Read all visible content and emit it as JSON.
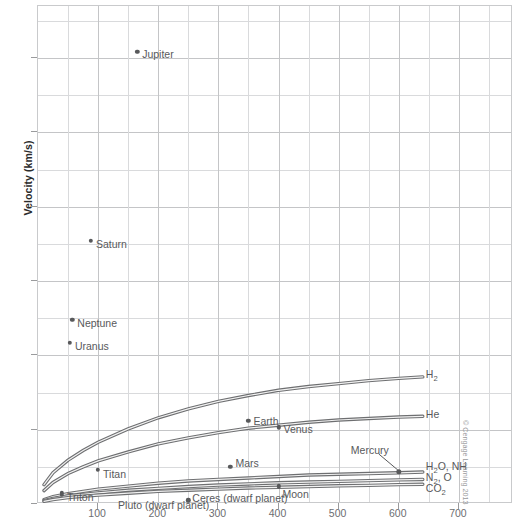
{
  "watermark": "© Cengage Learning 2013",
  "chart_data": {
    "type": "scatter",
    "title": "",
    "xlabel": "",
    "ylabel": "Velocity (km/s)",
    "xlim": [
      0,
      790
    ],
    "ylim": [
      0,
      67
    ],
    "grid": true,
    "legend_position": "inline-right",
    "x_ticks": [
      100,
      200,
      300,
      400,
      500,
      600,
      700
    ],
    "x_tick_labels": [
      "100",
      "200",
      "300",
      "400",
      "500",
      "600",
      "700"
    ],
    "x_minor_step": 50,
    "y_ticks": [
      0,
      10,
      20,
      30,
      40,
      50,
      60
    ],
    "y_tick_labels": [
      "0",
      "10",
      "20",
      "30",
      "40",
      "50",
      "60"
    ],
    "y_minor_step": 5,
    "points": [
      {
        "name": "Jupiter",
        "x": 165,
        "y": 60.8,
        "label": "Jupiter",
        "label_dx": 5,
        "label_dy": 2
      },
      {
        "name": "Saturn",
        "x": 88,
        "y": 35.4,
        "label": "Saturn",
        "label_dx": 5,
        "label_dy": 3
      },
      {
        "name": "Neptune",
        "x": 57,
        "y": 24.8,
        "label": "Neptune",
        "label_dx": 5,
        "label_dy": 3
      },
      {
        "name": "Uranus",
        "x": 53,
        "y": 21.7,
        "label": "Uranus",
        "label_dx": 5,
        "label_dy": 3
      },
      {
        "name": "Earth",
        "x": 350,
        "y": 11.2,
        "label": "Earth",
        "label_dx": 5,
        "label_dy": 0
      },
      {
        "name": "Venus",
        "x": 400,
        "y": 10.3,
        "label": "Venus",
        "label_dx": 5,
        "label_dy": 2
      },
      {
        "name": "Mars",
        "x": 320,
        "y": 5.0,
        "label": "Mars",
        "label_dx": 5,
        "label_dy": -4
      },
      {
        "name": "Titan",
        "x": 100,
        "y": 4.6,
        "label": "Titan",
        "label_dx": 5,
        "label_dy": 4
      },
      {
        "name": "Triton",
        "x": 40,
        "y": 1.5,
        "label": "Triton",
        "label_dx": 5,
        "label_dy": 4
      },
      {
        "name": "Pluto (dwarf planet)",
        "x": 40,
        "y": 1.2,
        "label": "Pluto (dwarf planet)",
        "label_dx": 56,
        "label_dy": 10
      },
      {
        "name": "Ceres (dwarf planet)",
        "x": 250,
        "y": 0.5,
        "label": "Ceres (dwarf planet)",
        "label_dx": 4,
        "label_dy": -2
      },
      {
        "name": "Moon",
        "x": 400,
        "y": 2.4,
        "label": "Moon",
        "label_dx": 4,
        "label_dy": 8
      },
      {
        "name": "Mercury",
        "x": 600,
        "y": 4.3,
        "label": "Mercury",
        "label_dx": -48,
        "label_dy": -22
      }
    ],
    "curves": [
      {
        "name": "H2",
        "label": "H",
        "label_sub": "2",
        "label_extra": "",
        "points": [
          [
            10,
            2.6
          ],
          [
            25,
            4.2
          ],
          [
            50,
            5.9
          ],
          [
            75,
            7.2
          ],
          [
            100,
            8.3
          ],
          [
            150,
            10.1
          ],
          [
            200,
            11.6
          ],
          [
            250,
            12.8
          ],
          [
            300,
            13.8
          ],
          [
            350,
            14.6
          ],
          [
            400,
            15.3
          ],
          [
            450,
            15.8
          ],
          [
            500,
            16.2
          ],
          [
            550,
            16.6
          ],
          [
            600,
            16.9
          ],
          [
            640,
            17.1
          ]
        ]
      },
      {
        "name": "He",
        "label": "He",
        "label_sub": "",
        "label_extra": "",
        "points": [
          [
            10,
            1.8
          ],
          [
            25,
            2.9
          ],
          [
            50,
            4.1
          ],
          [
            75,
            5.0
          ],
          [
            100,
            5.8
          ],
          [
            150,
            7.0
          ],
          [
            200,
            8.1
          ],
          [
            250,
            8.9
          ],
          [
            300,
            9.6
          ],
          [
            350,
            10.2
          ],
          [
            400,
            10.6
          ],
          [
            450,
            11.0
          ],
          [
            500,
            11.3
          ],
          [
            550,
            11.5
          ],
          [
            600,
            11.7
          ],
          [
            640,
            11.8
          ]
        ]
      },
      {
        "name": "H2O, NH3, CH4",
        "label": "H",
        "label_sub": "2",
        "label_extra": "O, NH₃, CH₄",
        "points": [
          [
            10,
            0.6
          ],
          [
            25,
            1.0
          ],
          [
            50,
            1.4
          ],
          [
            75,
            1.7
          ],
          [
            100,
            2.0
          ],
          [
            150,
            2.4
          ],
          [
            200,
            2.8
          ],
          [
            250,
            3.1
          ],
          [
            300,
            3.3
          ],
          [
            350,
            3.5
          ],
          [
            400,
            3.7
          ],
          [
            450,
            3.9
          ],
          [
            500,
            4.0
          ],
          [
            550,
            4.1
          ],
          [
            600,
            4.2
          ],
          [
            640,
            4.3
          ]
        ]
      },
      {
        "name": "N2, O2",
        "label": "N",
        "label_sub": "2",
        "label_extra": ", O₂",
        "points": [
          [
            10,
            0.45
          ],
          [
            25,
            0.75
          ],
          [
            50,
            1.1
          ],
          [
            75,
            1.3
          ],
          [
            100,
            1.5
          ],
          [
            150,
            1.85
          ],
          [
            200,
            2.1
          ],
          [
            250,
            2.35
          ],
          [
            300,
            2.55
          ],
          [
            350,
            2.7
          ],
          [
            400,
            2.85
          ],
          [
            450,
            2.95
          ],
          [
            500,
            3.05
          ],
          [
            550,
            3.15
          ],
          [
            600,
            3.25
          ],
          [
            640,
            3.3
          ]
        ]
      },
      {
        "name": "CO2",
        "label": "CO",
        "label_sub": "2",
        "label_extra": "",
        "points": [
          [
            10,
            0.35
          ],
          [
            25,
            0.6
          ],
          [
            50,
            0.85
          ],
          [
            75,
            1.05
          ],
          [
            100,
            1.2
          ],
          [
            150,
            1.45
          ],
          [
            200,
            1.7
          ],
          [
            250,
            1.85
          ],
          [
            300,
            2.0
          ],
          [
            350,
            2.15
          ],
          [
            400,
            2.25
          ],
          [
            450,
            2.35
          ],
          [
            500,
            2.45
          ],
          [
            550,
            2.5
          ],
          [
            600,
            2.6
          ],
          [
            640,
            2.65
          ]
        ]
      }
    ],
    "curve_labels": [
      {
        "name": "H2",
        "x": 645,
        "y": 17.4,
        "text": "H",
        "sub": "2",
        "after": ""
      },
      {
        "name": "He",
        "x": 645,
        "y": 12.0,
        "text": "He",
        "sub": "",
        "after": ""
      },
      {
        "name": "H2O_NH3_CH4",
        "x": 645,
        "y": 5.0,
        "text": "H",
        "sub": "2",
        "after": "O, NH"
      },
      {
        "name": "N2_O2",
        "x": 645,
        "y": 3.5,
        "text": "N",
        "sub": "2",
        "after": ", O"
      },
      {
        "name": "CO2",
        "x": 645,
        "y": 2.0,
        "text": "CO",
        "sub": "2",
        "after": ""
      }
    ]
  }
}
